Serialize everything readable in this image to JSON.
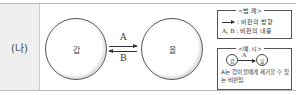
{
  "row_label": "(나)",
  "nodes": [
    {
      "id": "gap",
      "label": "갑"
    },
    {
      "id": "eul",
      "label": "을"
    }
  ],
  "edges": [
    {
      "from": "갑",
      "to": "을",
      "label": "A"
    },
    {
      "from": "을",
      "to": "갑",
      "label": "B"
    }
  ],
  "legend": {
    "title": "<범 례>",
    "arrow_desc": ": 비판의 방향",
    "ab_label": "A, B",
    "ab_desc": ": 비판의 내용"
  },
  "example": {
    "title": "<예 시>",
    "from": "갑",
    "edge_label": "A",
    "to": "을",
    "description": "A는 갑이 을에게 제기할 수 있는 비판임."
  }
}
